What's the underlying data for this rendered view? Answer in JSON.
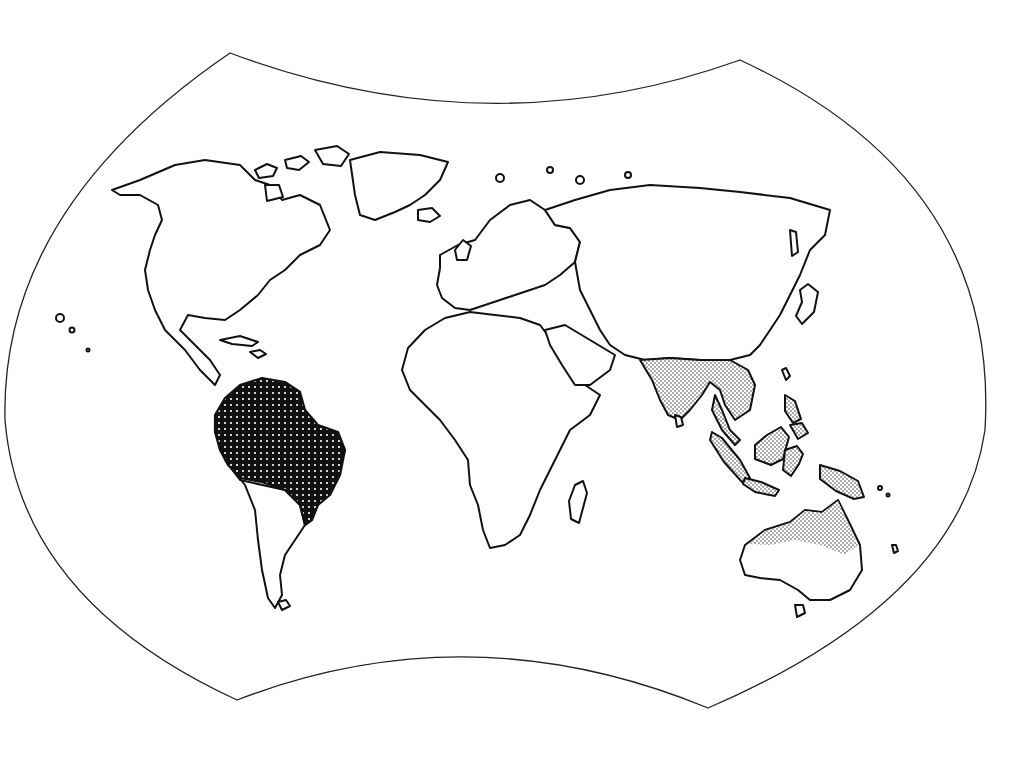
{
  "map": {
    "type": "world-outline-map",
    "projection_frame": "interrupted-curved",
    "colors": {
      "background": "#ffffff",
      "outline": "#222222",
      "dense_region": "#111111",
      "light_region_stipple": "#555555"
    },
    "highlighted_regions": [
      {
        "name": "northern-south-america",
        "pattern": "dense-dotted"
      },
      {
        "name": "south-and-southeast-asia",
        "pattern": "light-stipple"
      },
      {
        "name": "maritime-southeast-asia",
        "pattern": "light-stipple"
      },
      {
        "name": "northern-australia",
        "pattern": "light-stipple"
      }
    ]
  }
}
